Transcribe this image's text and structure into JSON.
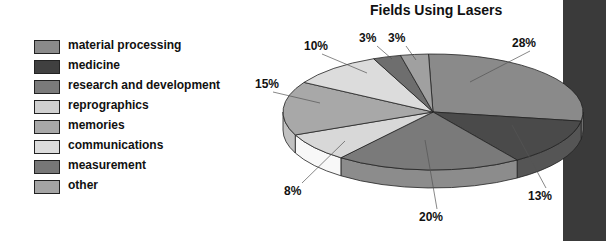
{
  "chart_data": {
    "type": "pie",
    "title": "Fields Using Lasers",
    "style": "3D exploded-less pie, grayscale",
    "legend_position": "left",
    "categories": [
      "material processing",
      "medicine",
      "research and development",
      "reprographics",
      "memories",
      "communications",
      "measurement",
      "other"
    ],
    "values": [
      28,
      13,
      20,
      8,
      15,
      10,
      3,
      3
    ],
    "labels": [
      "28%",
      "13%",
      "20%",
      "8%",
      "15%",
      "10%",
      "3%",
      "3%"
    ],
    "colors": [
      "#8a8a8a",
      "#4a4a4a",
      "#7a7a7a",
      "#d8d8d8",
      "#a8a8a8",
      "#dcdcdc",
      "#6e6e6e",
      "#a0a0a0"
    ],
    "unit": "%"
  },
  "legend": {
    "items": [
      {
        "label": "material processing",
        "color": "#8a8a8a"
      },
      {
        "label": "medicine",
        "color": "#404040"
      },
      {
        "label": "research and development",
        "color": "#7a7a7a"
      },
      {
        "label": "reprographics",
        "color": "#d0d0d0"
      },
      {
        "label": "memories",
        "color": "#a8a8a8"
      },
      {
        "label": "communications",
        "color": "#dcdcdc"
      },
      {
        "label": "measurement",
        "color": "#777777"
      },
      {
        "label": "other",
        "color": "#a4a4a4"
      }
    ]
  }
}
